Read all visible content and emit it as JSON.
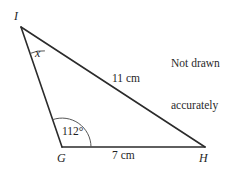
{
  "figure": {
    "type": "geometry-diagram",
    "shape": "triangle",
    "note": {
      "line1": "Not drawn",
      "line2": "accurately"
    },
    "vertices": [
      {
        "id": "I",
        "label": "I",
        "x": 21,
        "y": 27,
        "label_x": 14,
        "label_y": 10
      },
      {
        "id": "G",
        "label": "G",
        "x": 62,
        "y": 147,
        "label_x": 57,
        "label_y": 152
      },
      {
        "id": "H",
        "label": "H",
        "x": 205,
        "y": 147,
        "label_x": 199,
        "label_y": 152
      }
    ],
    "sides": [
      {
        "from": "I",
        "to": "H",
        "label": "11 cm",
        "label_x": 112,
        "label_y": 73
      },
      {
        "from": "G",
        "to": "H",
        "label": "7 cm",
        "label_x": 112,
        "label_y": 150
      },
      {
        "from": "I",
        "to": "G",
        "label": ""
      }
    ],
    "angles": [
      {
        "at": "I",
        "label": "x",
        "italic": true,
        "label_x": 35,
        "label_y": 47,
        "radius": 28
      },
      {
        "at": "G",
        "label": "112°",
        "italic": false,
        "label_x": 62,
        "label_y": 126,
        "radius": 29
      }
    ],
    "style": {
      "stroke": "#2b2b2b",
      "arc_stroke": "#5a5a5a",
      "background": "#ffffff",
      "line_width": 1.5,
      "arc_width": 1
    }
  }
}
